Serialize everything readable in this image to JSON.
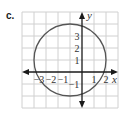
{
  "problem_label": "c.",
  "graph": {
    "x_axis_label": "x",
    "y_axis_label": "y",
    "x_tick_labels": [
      "−3",
      "−2",
      "−1",
      "1",
      "2"
    ],
    "y_tick_labels": [
      "3",
      "2",
      "1",
      "−1"
    ],
    "grid": {
      "x_min": -5,
      "x_max": 3,
      "y_min": -3,
      "y_max": 5,
      "step": 1
    },
    "circle": {
      "center_x": -1,
      "center_y": 1,
      "radius": 3,
      "equation": "(x+1)^2 + (y-1)^2 = 9"
    },
    "colors": {
      "grid": "#d0d0d0",
      "axis": "#1a1a1a",
      "circle": "#555555"
    }
  }
}
